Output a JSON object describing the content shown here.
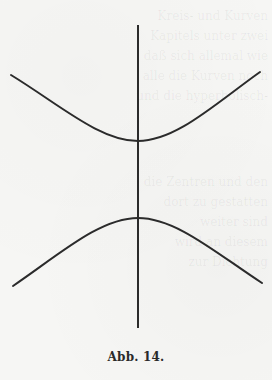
{
  "figure": {
    "caption": "Abb. 14.",
    "colors": {
      "ink": "#2b2b2b",
      "paper": "#f6f6f4"
    }
  },
  "bleed_through_text": {
    "upper_lines": [
      "Kreis- und Kurven",
      "Kapitels unter zwei",
      "daß sich allemal wie",
      "alle die Kurven noch",
      "und die hyperbolisch-"
    ],
    "lower_lines": [
      "die Zentren und den",
      "dort zu gestatten",
      "weiter sind",
      "wird an diesem",
      "zur Dichtung"
    ]
  }
}
